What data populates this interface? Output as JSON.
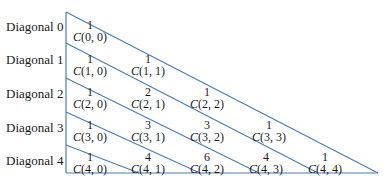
{
  "diagram": {
    "line_color": "#4a7fb5",
    "rows": [
      {
        "label": "Diagonal 0",
        "cells": [
          {
            "value": "1",
            "name": "C",
            "args": "(0, 0)"
          }
        ]
      },
      {
        "label": "Diagonal 1",
        "cells": [
          {
            "value": "1",
            "name": "C",
            "args": "(1, 0)"
          },
          {
            "value": "1",
            "name": "C",
            "args": "(1, 1)"
          }
        ]
      },
      {
        "label": "Diagonal 2",
        "cells": [
          {
            "value": "1",
            "name": "C",
            "args": "(2, 0)"
          },
          {
            "value": "2",
            "name": "C",
            "args": "(2, 1)"
          },
          {
            "value": "1",
            "name": "C",
            "args": "(2, 2)"
          }
        ]
      },
      {
        "label": "Diagonal 3",
        "cells": [
          {
            "value": "1",
            "name": "C",
            "args": "(3, 0)"
          },
          {
            "value": "3",
            "name": "C",
            "args": "(3, 1)"
          },
          {
            "value": "3",
            "name": "C",
            "args": "(3, 2)"
          },
          {
            "value": "1",
            "name": "C",
            "args": "(3, 3)"
          }
        ]
      },
      {
        "label": "Diagonal 4",
        "cells": [
          {
            "value": "1",
            "name": "C",
            "args": "(4, 0)"
          },
          {
            "value": "4",
            "name": "C",
            "args": "(4, 1)"
          },
          {
            "value": "6",
            "name": "C",
            "args": "(4, 2)"
          },
          {
            "value": "4",
            "name": "C",
            "args": "(4, 3)"
          },
          {
            "value": "1",
            "name": "C",
            "args": "(4, 4)"
          }
        ]
      }
    ]
  }
}
